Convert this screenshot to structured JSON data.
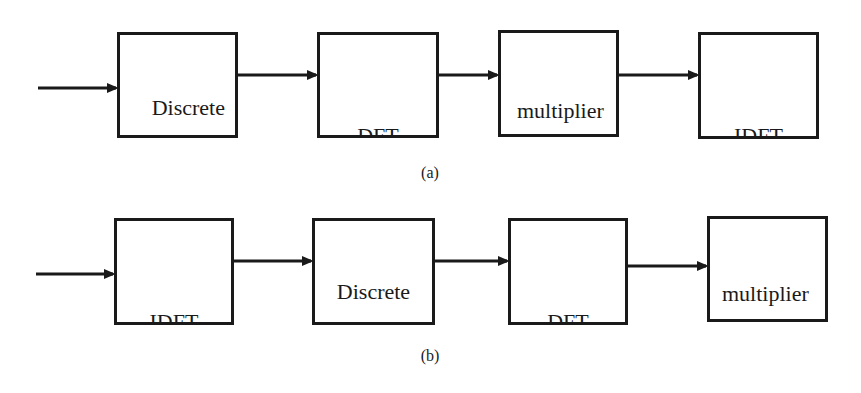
{
  "diagram": {
    "rows": [
      {
        "label": "(a)",
        "blocks": [
          {
            "id": "a1",
            "lines": [
              "Discrete",
              "overall",
              "channel"
            ]
          },
          {
            "id": "a2",
            "lines": [
              "DFT"
            ]
          },
          {
            "id": "a3",
            "lines": [
              "multiplier",
              "bank"
            ]
          },
          {
            "id": "a4",
            "lines": [
              "IDFT"
            ]
          }
        ],
        "connections": [
          "input -> Discrete overall channel",
          "Discrete overall channel -> DFT",
          "DFT -> multiplier bank",
          "multiplier bank -> IDFT"
        ]
      },
      {
        "label": "(b)",
        "blocks": [
          {
            "id": "b1",
            "lines": [
              "IDFT"
            ]
          },
          {
            "id": "b2",
            "lines": [
              "Discrete",
              "overall",
              "channel"
            ]
          },
          {
            "id": "b3",
            "lines": [
              "DFT"
            ]
          },
          {
            "id": "b4",
            "lines": [
              "multiplier",
              "bank"
            ]
          }
        ],
        "connections": [
          "input -> IDFT",
          "IDFT -> Discrete overall channel",
          "Discrete overall channel -> DFT",
          "DFT -> multiplier bank"
        ]
      }
    ],
    "colors": {
      "stroke": "#1a1a1a",
      "background": "#ffffff"
    }
  }
}
